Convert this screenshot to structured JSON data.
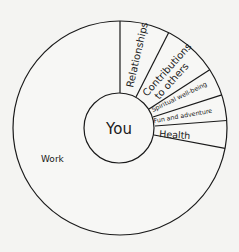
{
  "diagram": {
    "center_label": "You",
    "segments": [
      {
        "label": "Relationships",
        "start_deg": 63,
        "end_deg": 90
      },
      {
        "label_line1": "Contributions",
        "label_line2": "to others",
        "start_deg": 33,
        "end_deg": 63
      },
      {
        "label": "Spiritual well-being",
        "start_deg": 18,
        "end_deg": 33
      },
      {
        "label": "Fun and adventure",
        "start_deg": 4,
        "end_deg": 18
      },
      {
        "label": "Health",
        "start_deg": -11,
        "end_deg": 4
      },
      {
        "label": "Work",
        "start_deg": -270,
        "end_deg": -11
      }
    ],
    "colors": {
      "stroke": "#1a1a1a",
      "fill": "#f7f7f5",
      "background": "#f4f4f2"
    }
  }
}
